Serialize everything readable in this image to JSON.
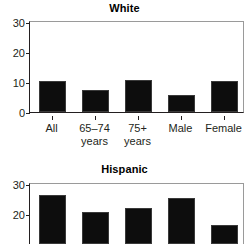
{
  "figure": {
    "panels": [
      "White",
      "Hispanic"
    ]
  },
  "chart_data": [
    {
      "type": "bar",
      "title": "White",
      "xlabel": "",
      "ylabel": "",
      "ylim": [
        0,
        30
      ],
      "yticks": [
        0,
        10,
        20,
        30
      ],
      "ytick_labels": [
        "0",
        "10",
        "20",
        "30"
      ],
      "grid": false,
      "legend": "none",
      "categories": [
        "All",
        "65–74 years",
        "75+ years",
        "Male",
        "Female"
      ],
      "category_lines": [
        {
          "line1": "All",
          "line2": ""
        },
        {
          "line1": "65–74",
          "line2": "years"
        },
        {
          "line1": "75+",
          "line2": "years"
        },
        {
          "line1": "Male",
          "line2": ""
        },
        {
          "line1": "Female",
          "line2": ""
        }
      ],
      "values": [
        10.2,
        7.2,
        10.6,
        5.7,
        10.4
      ],
      "bar_color": "#0d0d0d"
    },
    {
      "type": "bar",
      "title": "Hispanic",
      "xlabel": "",
      "ylabel": "",
      "ylim": [
        0,
        30
      ],
      "yticks": [
        20,
        30
      ],
      "ytick_labels": [
        "20",
        "30"
      ],
      "grid": false,
      "legend": "none",
      "note": "panel is cropped at the bottom of the image; x-axis line and tick labels are not visible",
      "categories": [
        "All",
        "65–74 years",
        "75+ years",
        "Male",
        "Female"
      ],
      "values": [
        26.2,
        20.7,
        22.0,
        25.3,
        16.3
      ],
      "bar_color": "#0d0d0d"
    }
  ]
}
